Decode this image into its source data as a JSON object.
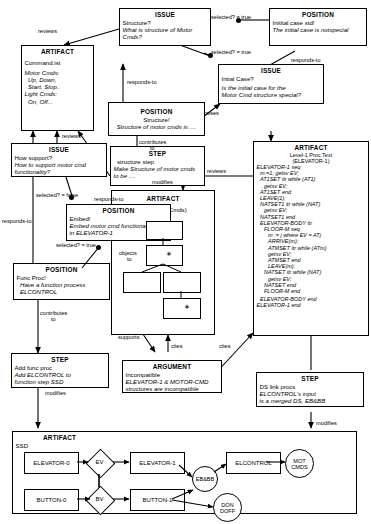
{
  "diagram": {
    "nodes": {
      "issue_structure": {
        "type": "ISSUE",
        "lines": [
          "Structure?",
          "What is structure of Motor",
          "Cmds?"
        ]
      },
      "position_initial_std": {
        "type": "POSITION",
        "lines": [
          "Initital case std!",
          "The initial case is notspecial"
        ]
      },
      "artifact_commandlist": {
        "type": "ARTIFACT",
        "lines": [
          "Command.ist",
          "Motor Cmds:",
          "Up, Down,",
          "Start, Stop..",
          "Light Cmds:",
          "On, Off..."
        ]
      },
      "issue_initial_case": {
        "type": "ISSUE",
        "lines": [
          "Intial Case?",
          "Is the initial case for the",
          "Motor Cmd structure special?"
        ]
      },
      "position_structure": {
        "type": "POSITION",
        "lines": [
          "Structure!",
          "Structure of motor cmds  is ...."
        ]
      },
      "issue_how_support": {
        "type": "ISSUE",
        "lines": [
          "How support?",
          "How to support motor cmd",
          "functionality?"
        ]
      },
      "step_structure": {
        "type": "STEP",
        "lines": [
          "structure step",
          "Make Structure of motor cmds",
          "to be ...."
        ]
      },
      "artifact_sd": {
        "type": "ARTIFACT",
        "lines": [
          "SD (Motor Cmds)"
        ]
      },
      "artifact_level1": {
        "type": "ARTIFACT",
        "lines": [
          "Level-1 Proc Text",
          "(ELEVATOR-1)",
          "ELEVATOR-1 seq",
          "m:=1; getsv EV;",
          "AT1SET itr while (AT1)",
          "getsv EV;",
          "AT1SET end",
          "LEAVE(1);",
          "NATSET1 itr while (NAT)",
          "getsv EV;",
          "NATSET1 end",
          "ELEVATOR-BODY itr",
          "FLOOR-M seq",
          "m := j where EV = ATj",
          "ARRIVE(m);",
          "ATMSET itr while (ATm)",
          "getsv EV;",
          "ATMSET end",
          "LEAVE(m);",
          "NATSET itr while (NAT)",
          "getsv EV;",
          "NATSET end",
          "FLOOR-M end",
          "ELEVATOR-BODY end",
          "ELEVATOR-1 end"
        ]
      },
      "position_embed": {
        "type": "POSITION",
        "lines": [
          "Embed!",
          "Embed motor cmd functionality",
          "in ELEVATOR-1"
        ]
      },
      "position_func_proc": {
        "type": "POSITION",
        "lines": [
          "Func Proc!",
          "Have a function process",
          "ELCONTROL"
        ]
      },
      "argument_incompatible": {
        "type": "ARGUMENT",
        "lines": [
          "Incompatible",
          "ELEVATOR-1 & MOTOR-CMD",
          "structures are incompatible"
        ]
      },
      "step_add_func_proc": {
        "type": "STEP",
        "lines": [
          "Add func proc",
          "Add ELCONTROL to",
          "function step SSD"
        ]
      },
      "step_ds_link": {
        "type": "STEP",
        "lines": [
          "DS link procs",
          "ELCONTROL's input",
          "is a merged DS, EB&BB"
        ]
      },
      "artifact_ssd": {
        "type": "ARTIFACT",
        "lines": [
          "SSD"
        ]
      }
    },
    "edge_labels": {
      "reviews_top": "reviews",
      "reviews_left": "reviews",
      "reviews_right": "reviews",
      "responds_to_1": "responds-to",
      "responds_to_2": "responds-to",
      "responds_to_3": "responds-to",
      "responds_to_4": "responds-to",
      "selected_true_1": "selected? = true",
      "selected_true_2": "selected? = true",
      "selected_false": "selected? = false",
      "selected_true_3": "selected? = true",
      "raises": "raises",
      "contributes_to_1": "contributes",
      "contributes_to_1b": "to",
      "contributes_to_2": "contributes",
      "contributes_to_2b": "to",
      "modifies_1": "modifies",
      "modifies_2": "modifies",
      "modifies_3": "modifies",
      "objects_to": "objects",
      "objects_to_b": "to",
      "supports": "supports",
      "cites_1": "cites",
      "cites_2": "cites"
    },
    "ssd": {
      "label": "SSD",
      "boxes": [
        "ELEVATOR-0",
        "ELEVATOR-1",
        "BUTTON-0",
        "BUTTON-1",
        "ELCONTROL"
      ],
      "diamonds": [
        "EV",
        "BV"
      ],
      "circles": [
        "EB&BB",
        "MOT CMDS",
        "DON DOFF"
      ]
    }
  }
}
